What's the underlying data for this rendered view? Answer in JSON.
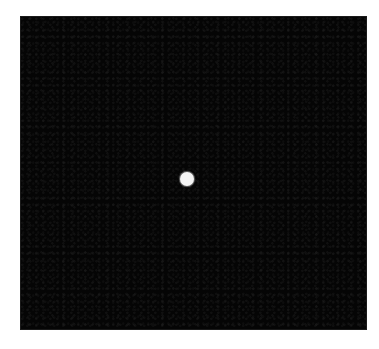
{
  "image": {
    "description": "Dark square field with a single bright white dot near the center",
    "background_color": "#ffffff",
    "field_color": "#050505",
    "field": {
      "left": 21,
      "top": 17,
      "width": 345,
      "height": 312
    },
    "dot": {
      "color": "#f4f4f4",
      "center_x": 187,
      "center_y": 179,
      "diameter": 14
    }
  }
}
